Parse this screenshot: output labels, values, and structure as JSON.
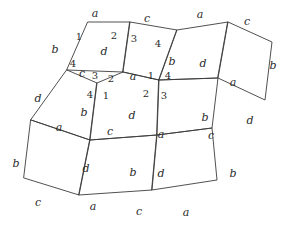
{
  "figure": {
    "stroke_color": "#3c3c3c",
    "text_color": "#2b2b2b",
    "background": "#ffffff",
    "width": 289,
    "height": 225,
    "edge_label_alphabet": [
      "a",
      "b",
      "c",
      "d"
    ],
    "vertex_label_numbers": [
      "1",
      "2",
      "3",
      "4"
    ]
  },
  "chart_data": {
    "type": "diagram",
    "subtype": "polygon-tiling",
    "tiles": [
      {
        "id": "T1",
        "points": "88,22 130,22 123,72 67,70",
        "edges": [
          "a",
          "d",
          "c",
          "b"
        ]
      },
      {
        "id": "T2",
        "points": "130,22 177,30 159,80 123,72",
        "edges": [
          "c",
          "b",
          "a",
          "d"
        ]
      },
      {
        "id": "T3",
        "points": "177,30 228,22 218,78 159,80",
        "edges": [
          "a",
          "d",
          "c",
          "b"
        ]
      },
      {
        "id": "T4",
        "points": "228,22 272,42 265,100 218,78",
        "edges": [
          "c",
          "b",
          "d",
          "a"
        ]
      },
      {
        "id": "T5",
        "points": "67,70 97,83 90,140 31,120",
        "edges": [
          "c",
          "b",
          "a",
          "d"
        ]
      },
      {
        "id": "T6",
        "points": "97,83 123,72 159,80 157,135 90,140",
        "edges": [
          "a",
          "d",
          "c",
          "b"
        ]
      },
      {
        "id": "T7",
        "points": "159,80 218,78 212,128 157,135",
        "edges": [
          "a",
          "d",
          "c",
          "b"
        ]
      },
      {
        "id": "T8",
        "points": "31,120 90,140 79,195 24,178",
        "edges": [
          "a",
          "d",
          "c",
          "b"
        ]
      },
      {
        "id": "T9",
        "points": "90,140 157,135 152,190 79,195",
        "edges": [
          "c",
          "d",
          "a",
          "b"
        ]
      },
      {
        "id": "T10",
        "points": "157,135 212,128 217,180 152,190",
        "edges": [
          "c",
          "b",
          "a",
          "d"
        ]
      }
    ],
    "edge_labels": [
      {
        "text": "a",
        "x": 95,
        "y": 13
      },
      {
        "text": "c",
        "x": 147,
        "y": 18
      },
      {
        "text": "a",
        "x": 200,
        "y": 14
      },
      {
        "text": "c",
        "x": 247,
        "y": 21
      },
      {
        "text": "b",
        "x": 55,
        "y": 49
      },
      {
        "text": "d",
        "x": 104,
        "y": 51
      },
      {
        "text": "b",
        "x": 273,
        "y": 65
      },
      {
        "text": "b",
        "x": 172,
        "y": 61
      },
      {
        "text": "d",
        "x": 203,
        "y": 63
      },
      {
        "text": "c",
        "x": 82,
        "y": 73
      },
      {
        "text": "a",
        "x": 133,
        "y": 76
      },
      {
        "text": "a",
        "x": 233,
        "y": 82
      },
      {
        "text": "d",
        "x": 38,
        "y": 98
      },
      {
        "text": "b",
        "x": 84,
        "y": 112
      },
      {
        "text": "d",
        "x": 132,
        "y": 115
      },
      {
        "text": "b",
        "x": 205,
        "y": 117
      },
      {
        "text": "d",
        "x": 250,
        "y": 120
      },
      {
        "text": "a",
        "x": 59,
        "y": 127
      },
      {
        "text": "c",
        "x": 110,
        "y": 131
      },
      {
        "text": "a",
        "x": 161,
        "y": 134
      },
      {
        "text": "c",
        "x": 211,
        "y": 135
      },
      {
        "text": "b",
        "x": 16,
        "y": 163
      },
      {
        "text": "d",
        "x": 86,
        "y": 168
      },
      {
        "text": "b",
        "x": 133,
        "y": 172
      },
      {
        "text": "d",
        "x": 161,
        "y": 173
      },
      {
        "text": "b",
        "x": 233,
        "y": 173
      },
      {
        "text": "c",
        "x": 38,
        "y": 202
      },
      {
        "text": "a",
        "x": 93,
        "y": 206
      },
      {
        "text": "c",
        "x": 139,
        "y": 211
      },
      {
        "text": "a",
        "x": 186,
        "y": 212
      }
    ],
    "vertex_labels": [
      {
        "text": "1",
        "x": 79,
        "y": 37
      },
      {
        "text": "2",
        "x": 114,
        "y": 36
      },
      {
        "text": "3",
        "x": 134,
        "y": 39
      },
      {
        "text": "4",
        "x": 158,
        "y": 44
      },
      {
        "text": "4",
        "x": 73,
        "y": 64
      },
      {
        "text": "3",
        "x": 95,
        "y": 76
      },
      {
        "text": "2",
        "x": 111,
        "y": 79
      },
      {
        "text": "1",
        "x": 151,
        "y": 76
      },
      {
        "text": "4",
        "x": 168,
        "y": 76
      },
      {
        "text": "4",
        "x": 90,
        "y": 95
      },
      {
        "text": "1",
        "x": 106,
        "y": 96
      },
      {
        "text": "2",
        "x": 146,
        "y": 94
      },
      {
        "text": "3",
        "x": 164,
        "y": 96
      }
    ]
  }
}
